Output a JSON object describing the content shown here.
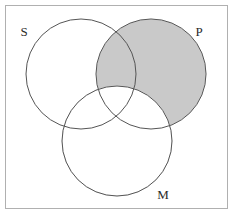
{
  "figure": {
    "kind": "venn-diagram",
    "frame": {
      "border_color": "#b0b0b0",
      "background_color": "#ffffff"
    },
    "shading": {
      "fill_color": "#c9c9c9",
      "region": "P-outside-M",
      "description": "The P circle is shaded everywhere except the portion overlapping M"
    },
    "stroke": {
      "circle_color": "#555555",
      "circle_width": 1
    },
    "circles": [
      {
        "id": "S",
        "label": "S",
        "cx": 81,
        "cy": 74,
        "r": 55,
        "shaded": false,
        "label_x": 24,
        "label_y": 33
      },
      {
        "id": "P",
        "label": "P",
        "cx": 151,
        "cy": 74,
        "r": 55,
        "shaded": true,
        "label_x": 199,
        "label_y": 33
      },
      {
        "id": "M",
        "label": "M",
        "cx": 117,
        "cy": 141,
        "r": 55,
        "shaded": false,
        "label_x": 163,
        "label_y": 196
      }
    ]
  }
}
